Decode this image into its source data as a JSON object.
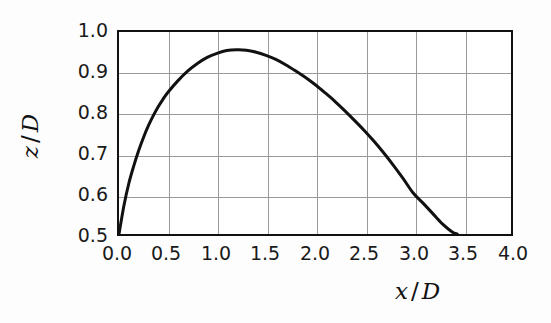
{
  "figure": {
    "background_color": "#fdfdfd",
    "plot_background_color": "#ffffff",
    "frame_color": "#111111",
    "grid_color": "#9a9a9a",
    "curve_color": "#111111"
  },
  "axes": {
    "x_label_var": "x",
    "x_label_sep": "/",
    "x_label_den": "D",
    "y_label_var": "z",
    "y_label_sep": "/",
    "y_label_den": "D",
    "x_ticks": [
      "0.0",
      "0.5",
      "1.0",
      "1.5",
      "2.0",
      "2.5",
      "3.0",
      "3.5",
      "4.0"
    ],
    "y_ticks": [
      "1.0",
      "0.9",
      "0.8",
      "0.7",
      "0.6",
      "0.5"
    ]
  },
  "chart_data": {
    "type": "line",
    "title": "",
    "subtitle": "",
    "xlabel": "x / D",
    "ylabel": "z / D",
    "xlim": [
      0.0,
      4.0
    ],
    "ylim": [
      0.5,
      1.0
    ],
    "xticks": [
      0.0,
      0.5,
      1.0,
      1.5,
      2.0,
      2.5,
      3.0,
      3.5,
      4.0
    ],
    "yticks": [
      0.5,
      0.6,
      0.7,
      0.8,
      0.9,
      1.0
    ],
    "grid": true,
    "legend": null,
    "legend_position": "none",
    "annotations": [],
    "series": [
      {
        "name": "trajectory",
        "color": "#111111",
        "linewidth": 3,
        "x": [
          0.0,
          0.05,
          0.1,
          0.15,
          0.2,
          0.25,
          0.3,
          0.35,
          0.4,
          0.45,
          0.5,
          0.6,
          0.7,
          0.8,
          0.9,
          1.0,
          1.1,
          1.2,
          1.3,
          1.4,
          1.5,
          1.6,
          1.7,
          1.8,
          1.9,
          2.0,
          2.1,
          2.2,
          2.3,
          2.4,
          2.5,
          2.6,
          2.7,
          2.8,
          2.9,
          3.0,
          3.1,
          3.2,
          3.3,
          3.4,
          3.45
        ],
        "y": [
          0.5,
          0.57,
          0.625,
          0.668,
          0.706,
          0.739,
          0.768,
          0.793,
          0.815,
          0.834,
          0.851,
          0.879,
          0.903,
          0.922,
          0.937,
          0.947,
          0.954,
          0.956,
          0.955,
          0.95,
          0.942,
          0.932,
          0.919,
          0.904,
          0.888,
          0.87,
          0.85,
          0.829,
          0.806,
          0.782,
          0.757,
          0.73,
          0.701,
          0.67,
          0.637,
          0.602,
          0.577,
          0.551,
          0.525,
          0.505,
          0.5
        ]
      }
    ],
    "key_points": {
      "start": {
        "x": 0.0,
        "z": 0.5
      },
      "peak": {
        "x": 1.2,
        "z": 0.956
      },
      "end": {
        "x": 3.45,
        "z": 0.5
      }
    }
  }
}
